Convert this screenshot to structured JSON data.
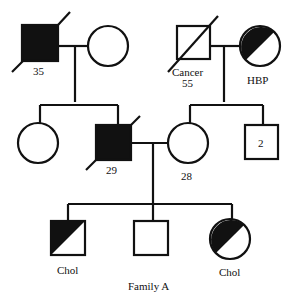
{
  "title": "Family A",
  "generation1": {
    "left_couple": {
      "male": {
        "label": "35",
        "affected": "full",
        "deceased": true
      },
      "female": {
        "label": "",
        "affected": "none",
        "deceased": false
      }
    },
    "right_couple": {
      "male": {
        "label_line1": "Cancer",
        "label_line2": "55",
        "affected": "none",
        "deceased": true
      },
      "female": {
        "label": "HBP",
        "affected": "half",
        "deceased": false
      }
    }
  },
  "generation2": {
    "daughter": {
      "label": "",
      "affected": "none"
    },
    "son": {
      "label": "29",
      "affected": "full",
      "deceased": true
    },
    "wife": {
      "label": "28",
      "affected": "none"
    },
    "brothers": {
      "count_label": "2",
      "affected": "none"
    }
  },
  "generation3": {
    "son1": {
      "label": "Chol",
      "affected": "half"
    },
    "son2": {
      "label": "",
      "affected": "none"
    },
    "daughter": {
      "label": "Chol",
      "affected": "half"
    }
  },
  "colors": {
    "line": "#111111",
    "fill": "#111111",
    "background": "#ffffff"
  }
}
